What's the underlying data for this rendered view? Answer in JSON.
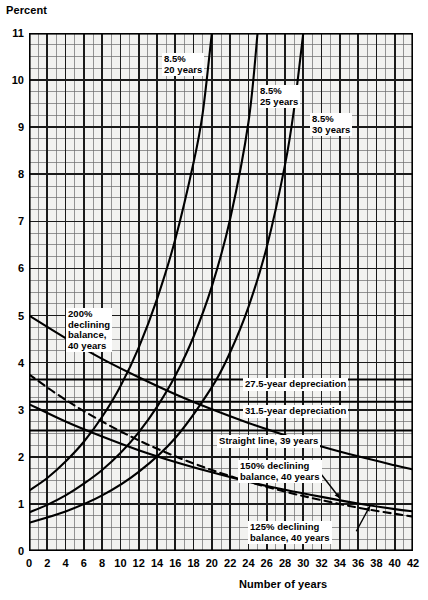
{
  "chart_data": {
    "type": "line",
    "title": "",
    "ylabel": "Percent",
    "xlabel": "Number of years",
    "xlim": [
      0,
      42
    ],
    "ylim": [
      0,
      11
    ],
    "xticks": [
      "0",
      "2",
      "4",
      "6",
      "8",
      "10",
      "12",
      "14",
      "16",
      "18",
      "20",
      "22",
      "24",
      "26",
      "28",
      "30",
      "32",
      "34",
      "36",
      "38",
      "40",
      "42"
    ],
    "yticks": [
      "0",
      "1",
      "2",
      "3",
      "4",
      "5",
      "6",
      "7",
      "8",
      "9",
      "10",
      "11"
    ],
    "grid": "minor grid every 1 year horizontally and 0.25 percent vertically; major grid every 2 years and 1 percent",
    "legend_position": "inline annotations on plot",
    "series": [
      {
        "name": "8.5% 20 years",
        "style": "solid",
        "annotation": "8.5%\n20 years",
        "x": [
          0,
          2,
          4,
          6,
          8,
          10,
          12,
          14,
          16,
          18,
          19,
          20
        ],
        "values": [
          1.28,
          1.55,
          1.9,
          2.32,
          2.85,
          3.5,
          4.32,
          5.35,
          6.62,
          8.25,
          9.3,
          11.0
        ]
      },
      {
        "name": "8.5% 25 years",
        "style": "solid",
        "annotation": "8.5%\n25 years",
        "x": [
          0,
          2,
          4,
          6,
          8,
          10,
          12,
          14,
          16,
          18,
          20,
          22,
          24,
          25
        ],
        "values": [
          0.82,
          0.98,
          1.18,
          1.43,
          1.72,
          2.08,
          2.52,
          3.06,
          3.72,
          4.55,
          5.62,
          7.05,
          9.1,
          11.0
        ]
      },
      {
        "name": "8.5% 30 years",
        "style": "solid",
        "annotation": "8.5%\n30 years",
        "x": [
          0,
          4,
          8,
          12,
          16,
          20,
          22,
          24,
          26,
          28,
          29,
          30
        ],
        "values": [
          0.6,
          0.84,
          1.18,
          1.68,
          2.4,
          3.48,
          4.22,
          5.18,
          6.45,
          8.2,
          9.4,
          11.0
        ]
      },
      {
        "name": "200% declining balance, 40 years",
        "style": "solid",
        "annotation": "200%\ndeclining\nbalance,\n40 years",
        "x": [
          0,
          4,
          8,
          12,
          16,
          20,
          24,
          28,
          32,
          36,
          40,
          42
        ],
        "values": [
          5.0,
          4.52,
          4.08,
          3.69,
          3.33,
          3.01,
          2.72,
          2.46,
          2.22,
          2.01,
          1.82,
          1.73
        ]
      },
      {
        "name": "150% declining balance, 40 years",
        "style": "dashed",
        "annotation": "150% declining\nbalance, 40 years",
        "x": [
          0,
          4,
          8,
          12,
          16,
          20,
          24,
          28,
          32,
          36,
          40,
          42
        ],
        "values": [
          3.75,
          3.21,
          2.75,
          2.35,
          2.01,
          1.72,
          1.47,
          1.26,
          1.08,
          0.92,
          0.79,
          0.73
        ]
      },
      {
        "name": "125% declining balance, 40 years",
        "style": "solid",
        "annotation": "125% declining\nbalance, 40 years",
        "x": [
          0,
          4,
          8,
          12,
          16,
          20,
          24,
          28,
          32,
          36,
          40,
          42
        ],
        "values": [
          3.12,
          2.75,
          2.43,
          2.14,
          1.89,
          1.67,
          1.47,
          1.3,
          1.15,
          1.01,
          0.89,
          0.84
        ]
      },
      {
        "name": "27.5-year depreciation",
        "style": "solid-horizontal",
        "annotation": "27.5-year depreciation",
        "x": [
          0,
          42
        ],
        "values": [
          3.64,
          3.64
        ]
      },
      {
        "name": "31.5-year depreciation",
        "style": "solid-horizontal",
        "annotation": "31.5-year depreciation",
        "x": [
          0,
          42
        ],
        "values": [
          3.17,
          3.17
        ]
      },
      {
        "name": "Straight line, 39 years",
        "style": "solid-horizontal",
        "annotation": "Straight line, 39 years",
        "x": [
          0,
          42
        ],
        "values": [
          2.56,
          2.56
        ]
      }
    ],
    "annotations": [
      {
        "id": "a1",
        "text": "8.5%\n20 years"
      },
      {
        "id": "a2",
        "text": "8.5%\n25 years"
      },
      {
        "id": "a3",
        "text": "8.5%\n30 years"
      },
      {
        "id": "a4",
        "text": "200%\ndeclining\nbalance,\n40 years"
      },
      {
        "id": "a5",
        "text": "27.5-year depreciation"
      },
      {
        "id": "a6",
        "text": "31.5-year depreciation"
      },
      {
        "id": "a7",
        "text": "Straight line, 39 years"
      },
      {
        "id": "a8",
        "text": "150% declining\nbalance, 40 years"
      },
      {
        "id": "a9",
        "text": "125% declining\nbalance, 40 years"
      }
    ]
  },
  "axes": {
    "y_title": "Percent",
    "x_title": "Number of years",
    "y_ticks": [
      "11",
      "10",
      "9",
      "8",
      "7",
      "6",
      "5",
      "4",
      "3",
      "2",
      "1",
      "0"
    ],
    "x_ticks": [
      "0",
      "2",
      "4",
      "6",
      "8",
      "10",
      "12",
      "14",
      "16",
      "18",
      "20",
      "22",
      "24",
      "26",
      "28",
      "30",
      "32",
      "34",
      "36",
      "38",
      "40",
      "42"
    ]
  },
  "labels": {
    "l20": "8.5%",
    "l20b": "20 years",
    "l25": "8.5%",
    "l25b": "25 years",
    "l30": "8.5%",
    "l30b": "30 years",
    "db200_1": "200%",
    "db200_2": "declining",
    "db200_3": "balance,",
    "db200_4": "40 years",
    "dep275": "27.5-year depreciation",
    "dep315": "31.5-year depreciation",
    "sl39": "Straight line, 39 years",
    "db150_1": "150% declining",
    "db150_2": "balance, 40 years",
    "db125_1": "125% declining",
    "db125_2": "balance, 40 years"
  },
  "colors": {
    "ink": "#000000",
    "grid_minor": "#6b6b6b",
    "grid_major": "#1a1a1a",
    "paper": "#ffffff",
    "plot_fill": "#f2f2f0"
  }
}
